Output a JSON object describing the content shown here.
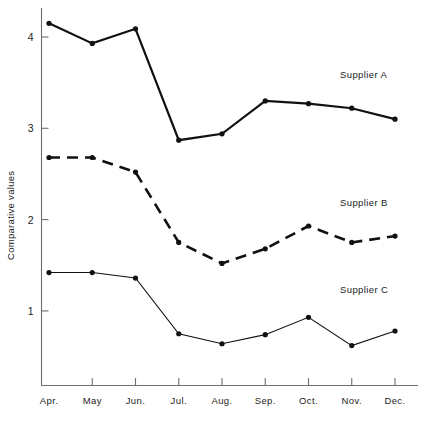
{
  "chart_data": {
    "type": "line",
    "title": "",
    "subtitle": "",
    "xlabel": "",
    "ylabel": "Comparative values",
    "categories": [
      "Apr.",
      "May",
      "Jun.",
      "Jul.",
      "Aug.",
      "Sep.",
      "Oct.",
      "Nov.",
      "Dec."
    ],
    "x_tick_labels": [
      "Apr.",
      "May",
      "Jun.",
      "Jul.",
      "Aug.",
      "Sep.",
      "Oct.",
      "Nov.",
      "Dec."
    ],
    "y_tick_labels": [
      "1",
      "2",
      "3",
      "4"
    ],
    "y_ticks": [
      1,
      2,
      3,
      4
    ],
    "ylim": [
      0,
      4.4
    ],
    "grid": false,
    "legend_position": "inline-right",
    "series": [
      {
        "name": "Supplier A",
        "label": "Supplier A",
        "style": "solid",
        "color": "#111111",
        "values": [
          4.15,
          3.93,
          4.09,
          2.87,
          2.94,
          3.3,
          3.27,
          3.22,
          3.1
        ]
      },
      {
        "name": "Supplier B",
        "label": "Supplier B",
        "style": "dashed",
        "color": "#111111",
        "values": [
          2.68,
          2.68,
          2.52,
          1.75,
          1.52,
          1.68,
          1.93,
          1.75,
          1.82
        ]
      },
      {
        "name": "Supplier C",
        "label": "Supplier C",
        "style": "thin-solid",
        "color": "#111111",
        "values": [
          1.42,
          1.42,
          1.36,
          0.75,
          0.64,
          0.74,
          0.93,
          0.62,
          0.78
        ]
      }
    ],
    "annotations": [
      {
        "text": "Supplier A",
        "x": "Dec.",
        "y": 3.55
      },
      {
        "text": "Supplier B",
        "x": "Dec.",
        "y": 2.15
      },
      {
        "text": "Supplier C",
        "x": "Dec.",
        "y": 1.2
      }
    ]
  },
  "axes": {
    "y_axis_title": "Comparative values"
  }
}
